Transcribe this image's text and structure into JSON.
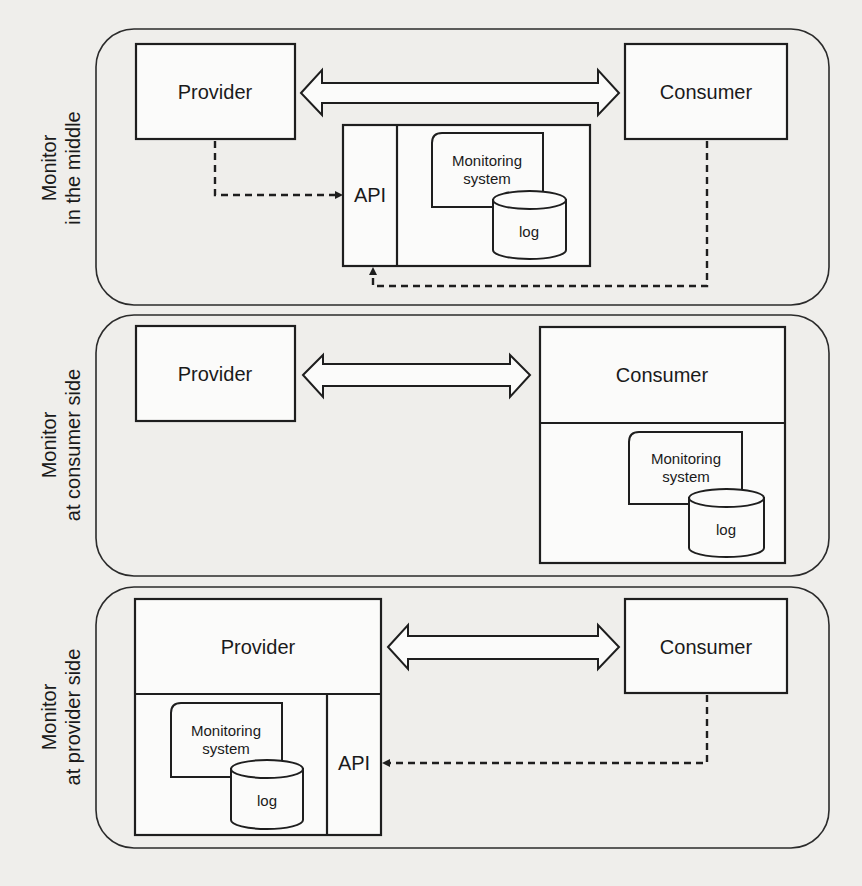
{
  "diagram": {
    "panels": [
      {
        "id": "middle",
        "side_label": [
          "Monitor",
          "in the middle"
        ],
        "provider": "Provider",
        "consumer": "Consumer",
        "api": "API",
        "monitoring_system": [
          "Monitoring",
          "system"
        ],
        "log": "log",
        "monitor_location": "middle"
      },
      {
        "id": "consumer-side",
        "side_label": [
          "Monitor",
          "at consumer side"
        ],
        "provider": "Provider",
        "consumer": "Consumer",
        "monitoring_system": [
          "Monitoring",
          "system"
        ],
        "log": "log",
        "monitor_location": "consumer"
      },
      {
        "id": "provider-side",
        "side_label": [
          "Monitor",
          "at provider side"
        ],
        "provider": "Provider",
        "consumer": "Consumer",
        "api": "API",
        "monitoring_system": [
          "Monitoring",
          "system"
        ],
        "log": "log",
        "monitor_location": "provider"
      }
    ],
    "edges": {
      "solid_double_arrow": "Provider <-> Consumer interaction",
      "dashed_arrow": "Request to monitoring API"
    },
    "colors": {
      "background": "#efeeeb",
      "stroke": "#1e1e1e",
      "box_fill": "#fbfbfa"
    }
  }
}
